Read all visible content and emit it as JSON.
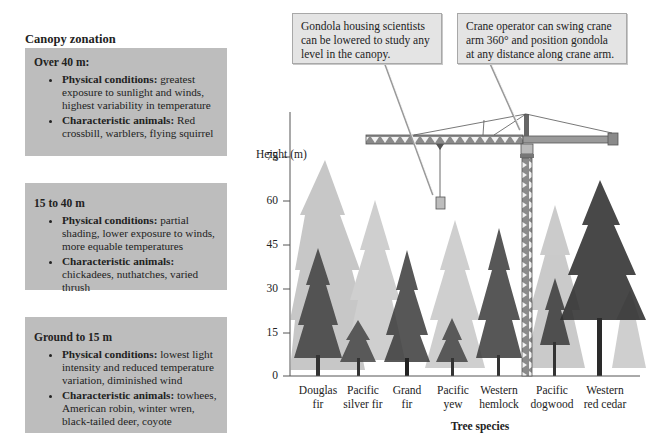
{
  "title": "Canopy zonation",
  "zones": [
    {
      "heading": "Over 40 m:",
      "physical_label": "Physical conditions:",
      "physical_text": " greatest exposure to sunlight and winds, highest variability in temperature",
      "animals_label": "Characteristic animals:",
      "animals_text": " Red crossbill, warblers, flying squirrel"
    },
    {
      "heading": "15 to 40 m",
      "physical_label": "Physical conditions:",
      "physical_text": " partial shading, lower exposure to winds, more equable temperatures",
      "animals_label": "Characteristic animals:",
      "animals_text": " chickadees, nuthatches, varied thrush"
    },
    {
      "heading": "Ground to 15 m",
      "physical_label": "Physical conditions:",
      "physical_text": " lowest light intensity and reduced temperature variation, diminished wind",
      "animals_label": "Characteristic animals:",
      "animals_text": " towhees, American robin, winter wren, black-tailed deer, coyote"
    }
  ],
  "callouts": {
    "gondola": "Gondola housing scientists can be lowered to study any level in the canopy.",
    "crane": "Crane operator can swing crane arm 360° and position gondola at any distance along crane arm."
  },
  "chart": {
    "ylabel": "Height (m)",
    "yticks": [
      "75",
      "60",
      "45",
      "30",
      "15",
      "0"
    ],
    "xtitle": "Tree species",
    "species": [
      {
        "line1": "Douglas",
        "line2": "fir"
      },
      {
        "line1": "Pacific",
        "line2": "silver fir"
      },
      {
        "line1": "Grand",
        "line2": "fir"
      },
      {
        "line1": "Pacific",
        "line2": "yew"
      },
      {
        "line1": "Western",
        "line2": "hemlock"
      },
      {
        "line1": "Pacific",
        "line2": "dogwood"
      },
      {
        "line1": "Western",
        "line2": "red cedar"
      }
    ]
  },
  "colors": {
    "zone_box": "#bdbdbd",
    "callout_box": "#e4e4e4",
    "crane": "#7a7a7a"
  }
}
